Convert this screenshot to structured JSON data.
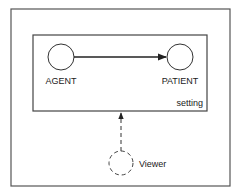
{
  "diagram": {
    "outer_frame": {
      "x": 11,
      "y": 9,
      "width": 219,
      "height": 177
    },
    "setting_box": {
      "x": 33,
      "y": 35,
      "width": 174,
      "height": 76,
      "label": "setting"
    },
    "nodes": [
      {
        "id": "agent",
        "label": "AGENT",
        "cx": 61,
        "cy": 57,
        "r": 13,
        "style": "solid"
      },
      {
        "id": "patient",
        "label": "PATIENT",
        "cx": 180,
        "cy": 57,
        "r": 13,
        "style": "solid"
      },
      {
        "id": "viewer",
        "label": "Viewer",
        "cx": 121,
        "cy": 163,
        "r": 12,
        "style": "dashed"
      }
    ],
    "edges": [
      {
        "from": "agent",
        "to": "patient",
        "style": "solid",
        "arrow": "end"
      },
      {
        "from": "viewer",
        "to": "setting",
        "style": "dashed",
        "arrow": "end"
      }
    ],
    "colors": {
      "stroke": "#333333",
      "text": "#1a1a1a",
      "background": "#ffffff"
    }
  }
}
